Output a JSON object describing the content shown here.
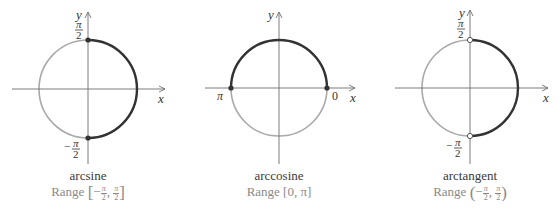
{
  "figure": {
    "colors": {
      "axis": "#6e6e6e",
      "circle_light": "#a9a9a9",
      "arc_dark": "#333333",
      "caption_name": "#3a3a3a",
      "caption_range": "#8a8a8a"
    },
    "panels": [
      {
        "id": "arcsine",
        "name": "arcsine",
        "range_prefix": "Range",
        "range_open": "[",
        "range_close": "]",
        "range_lower_sign": "−",
        "range_lower_num": "π",
        "range_lower_den": "2",
        "range_sep": ",",
        "range_upper_num": "π",
        "range_upper_den": "2",
        "axis_x_label": "x",
        "axis_y_label": "y",
        "top_label_num": "π",
        "top_label_den": "2",
        "bottom_label_sign": "−",
        "bottom_label_num": "π",
        "bottom_label_den": "2",
        "highlight": "right half (from -π/2 to π/2)",
        "endpoints": "closed"
      },
      {
        "id": "arccosine",
        "name": "arccosine",
        "range_text": "Range [0, π]",
        "range_prefix": "Range",
        "axis_x_label": "x",
        "axis_y_label": "y",
        "left_label": "π",
        "right_label": "0",
        "highlight": "upper half (from 0 to π)",
        "endpoints": "closed"
      },
      {
        "id": "arctangent",
        "name": "arctangent",
        "range_prefix": "Range",
        "range_open": "(",
        "range_close": ")",
        "range_lower_sign": "−",
        "range_lower_num": "π",
        "range_lower_den": "2",
        "range_sep": ",",
        "range_upper_num": "π",
        "range_upper_den": "2",
        "axis_x_label": "x",
        "axis_y_label": "y",
        "top_label_num": "π",
        "top_label_den": "2",
        "bottom_label_sign": "−",
        "bottom_label_num": "π",
        "bottom_label_den": "2",
        "highlight": "right half (from -π/2 to π/2)",
        "endpoints": "open"
      }
    ]
  }
}
